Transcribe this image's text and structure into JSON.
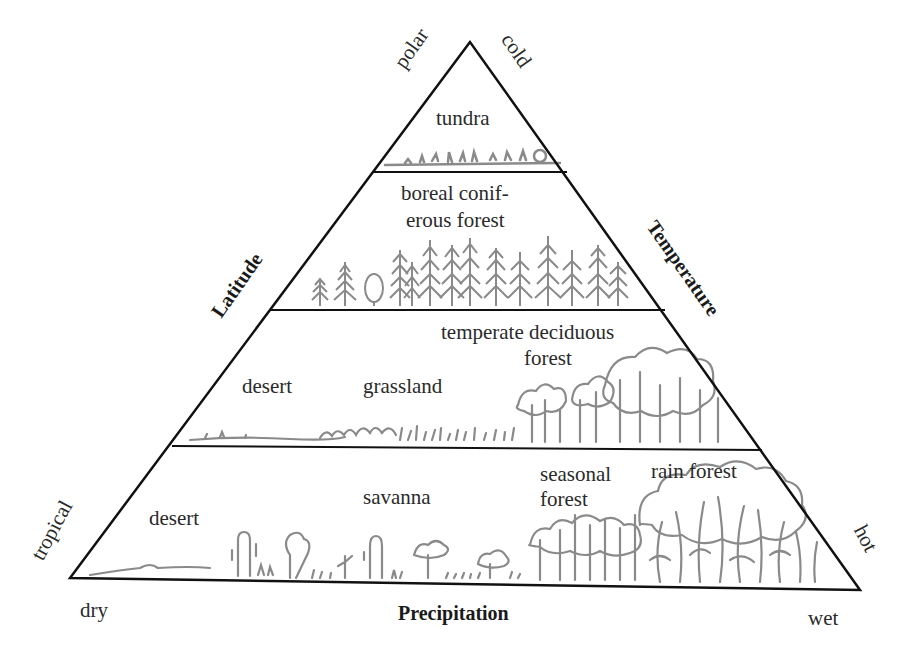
{
  "diagram": {
    "axes": {
      "left": "Latitude",
      "right": "Temperature",
      "bottom": "Precipitation"
    },
    "corner_labels": {
      "top_left": "polar",
      "top_right": "cold",
      "bottom_left_side": "tropical",
      "bottom_right_side": "hot",
      "base_left": "dry",
      "base_right": "wet"
    },
    "tiers": [
      {
        "name": "polar tier",
        "biomes": [
          {
            "label": "tundra"
          }
        ]
      },
      {
        "name": "boreal tier",
        "biomes": [
          {
            "label_line1": "boreal conif-",
            "label_line2": "erous forest"
          }
        ]
      },
      {
        "name": "temperate tier",
        "biomes": [
          {
            "label": "desert"
          },
          {
            "label": "grassland"
          },
          {
            "label_line1": "temperate deciduous",
            "label_line2": "forest"
          }
        ]
      },
      {
        "name": "tropical tier",
        "biomes": [
          {
            "label": "desert"
          },
          {
            "label": "savanna"
          },
          {
            "label_line1": "seasonal",
            "label_line2": "forest"
          },
          {
            "label": "rain forest"
          }
        ]
      }
    ],
    "colors": {
      "outline": "#111111",
      "vegetation": "#8a8a8a",
      "text": "#2a2a2a"
    }
  }
}
